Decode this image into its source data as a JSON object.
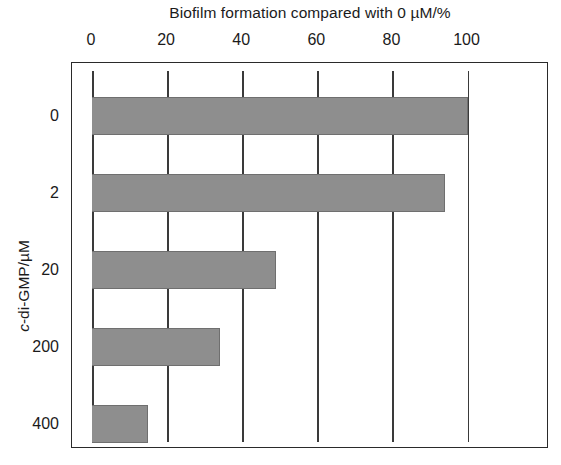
{
  "chart_data": {
    "type": "bar",
    "orientation": "horizontal",
    "title": "Biofilm formation compared with 0 µM/%",
    "xlabel": "",
    "ylabel": "c-di-GMP/µM",
    "ylabel_italic_part": "c",
    "categories": [
      "0",
      "2",
      "20",
      "200",
      "400"
    ],
    "values": [
      100,
      94,
      49,
      34,
      15
    ],
    "xlim": [
      0,
      110
    ],
    "xticks": [
      0,
      20,
      40,
      60,
      80,
      100
    ],
    "xtick_labels": [
      "0",
      "20",
      "40",
      "60",
      "80",
      "100"
    ],
    "grid": true,
    "grid_axis": "x",
    "legend": null,
    "bar_color": "#8e8e8e",
    "bar_edge_color": "#6f6f6f",
    "axis_color": "#2a2a2a",
    "background": "#ffffff"
  },
  "figure": {
    "title_text": "Biofilm formation compared with 0 µM/%",
    "y_axis_title_prefix": "c",
    "y_axis_title_suffix": "-di-GMP/µM"
  }
}
